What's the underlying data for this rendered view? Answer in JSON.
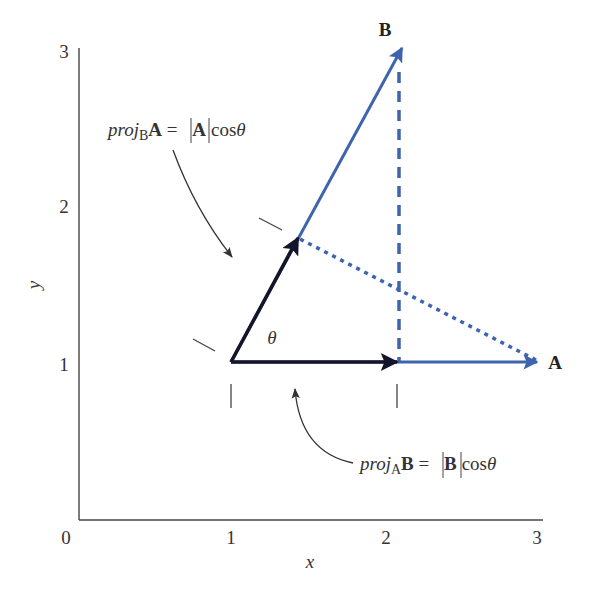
{
  "figure": {
    "axes": {
      "x_label": "x",
      "y_label": "y",
      "x_ticks": [
        "0",
        "1",
        "2",
        "3"
      ],
      "y_ticks": [
        "1",
        "2",
        "3"
      ]
    },
    "vectors": {
      "A": {
        "label": "A",
        "from": [
          1,
          1
        ],
        "to": [
          3,
          1
        ],
        "color": "#3d64ad"
      },
      "B": {
        "label": "B",
        "from": [
          1,
          1
        ],
        "to": [
          2.1,
          3
        ],
        "color": "#3d64ad"
      }
    },
    "projections": {
      "proj_B_A": {
        "prefix": "proj",
        "subscript": "B",
        "vector": "A",
        "equals": " = ",
        "abs_vector": "A",
        "trig": "cos",
        "angle": "θ"
      },
      "proj_A_B": {
        "prefix": "proj",
        "subscript": "A",
        "vector": "B",
        "equals": " = ",
        "abs_vector": "B",
        "trig": "cos",
        "angle": "θ"
      }
    },
    "angle_label": "θ",
    "colors": {
      "vector_blue": "#3d64ad",
      "projection_black": "#14142b",
      "axis": "#444444"
    }
  }
}
